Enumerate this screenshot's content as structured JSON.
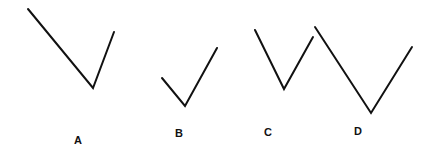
{
  "figure": {
    "background": "#ffffff",
    "stroke_color": "#111111",
    "shapes": [
      {
        "label": "A",
        "points": [
          [
            28,
            9
          ],
          [
            93,
            88
          ],
          [
            114,
            32
          ]
        ],
        "label_pos": [
          78,
          140
        ]
      },
      {
        "label": "B",
        "points": [
          [
            162,
            78
          ],
          [
            185,
            106
          ],
          [
            217,
            48
          ]
        ],
        "label_pos": [
          179,
          133
        ]
      },
      {
        "label": "C",
        "points": [
          [
            255,
            30
          ],
          [
            284,
            89
          ],
          [
            313,
            37
          ]
        ],
        "label_pos": [
          268,
          132
        ]
      },
      {
        "label": "D",
        "points": [
          [
            315,
            27
          ],
          [
            371,
            113
          ],
          [
            412,
            47
          ]
        ],
        "label_pos": [
          358,
          131
        ]
      }
    ]
  }
}
